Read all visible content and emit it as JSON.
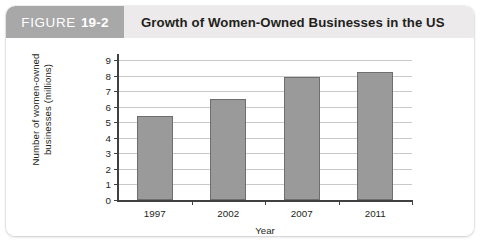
{
  "figure": {
    "badge_word": "FIGURE",
    "badge_number": "19-2",
    "title": "Growth of Women-Owned Businesses in the US"
  },
  "colors": {
    "badge_background": "#a8a8a8",
    "header_background": "#eceaea",
    "bar_fill": "#9a9a9a",
    "bar_border": "#6e6e6e",
    "gridline": "#c9c9c9",
    "axis": "#404040",
    "text": "#231f20",
    "card_background": "#ffffff"
  },
  "chart_data": {
    "type": "bar",
    "title": "Growth of Women-Owned Businesses in the US",
    "categories": [
      "1997",
      "2002",
      "2007",
      "2011"
    ],
    "values": [
      5.4,
      6.5,
      7.9,
      8.2
    ],
    "xlabel": "Year",
    "ylabel": "Number of women-owned businesses (millions)",
    "ylim": [
      0,
      9
    ],
    "ytick_labels": [
      "0",
      "1",
      "2",
      "3",
      "4",
      "5",
      "6",
      "7",
      "8",
      "9"
    ],
    "ytick_values": [
      0,
      1,
      2,
      3,
      4,
      5,
      6,
      7,
      8,
      9
    ],
    "grid": true,
    "legend": false
  }
}
